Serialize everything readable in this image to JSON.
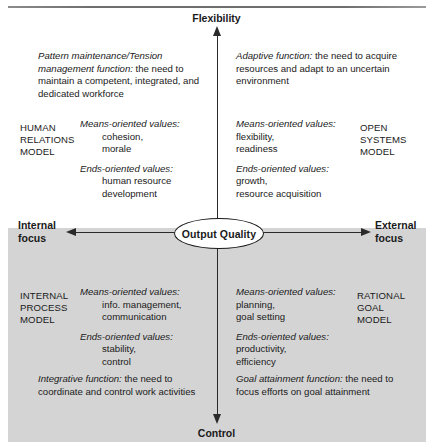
{
  "diagram": {
    "axes": {
      "top_label": "Flexibility",
      "bottom_label": "Control",
      "left_label_line1": "Internal",
      "left_label_line2": "focus",
      "right_label_line1": "External",
      "right_label_line2": "focus",
      "center_label": "Output Quality"
    },
    "colors": {
      "band_gray": "#d4d4d4",
      "line_black": "#2a2a2a",
      "text": "#1a1a1a",
      "background": "#ffffff"
    },
    "quadrants": [
      {
        "id": "top-left",
        "model_name_lines": [
          "HUMAN",
          "RELATIONS",
          "MODEL"
        ],
        "function_italic": "Pattern maintenance/Tension management function:",
        "function_rest": " the need to maintain a competent, integrated, and dedicated workforce",
        "means_header": "Means-oriented values:",
        "means_values": [
          "cohesion,",
          "morale"
        ],
        "ends_header": "Ends-oriented values:",
        "ends_values": [
          "human resource",
          "development"
        ]
      },
      {
        "id": "top-right",
        "model_name_lines": [
          "OPEN",
          "SYSTEMS",
          "MODEL"
        ],
        "function_italic": "Adaptive function:",
        "function_rest": " the need to acquire resources and adapt to an uncertain environment",
        "means_header": "Means-oriented values:",
        "means_values": [
          "flexibility,",
          "readiness"
        ],
        "ends_header": "Ends-oriented values:",
        "ends_values": [
          "growth,",
          "resource acquisition"
        ]
      },
      {
        "id": "bottom-left",
        "model_name_lines": [
          "INTERNAL",
          "PROCESS",
          "MODEL"
        ],
        "function_italic": "Integrative function:",
        "function_rest": " the need to coordinate and control work activities",
        "means_header": "Means-oriented values:",
        "means_values": [
          "info. management,",
          "communication"
        ],
        "ends_header": "Ends-oriented values:",
        "ends_values": [
          "stability,",
          "control"
        ]
      },
      {
        "id": "bottom-right",
        "model_name_lines": [
          "RATIONAL",
          "GOAL",
          "MODEL"
        ],
        "function_italic": "Goal attainment function:",
        "function_rest": " the need to focus efforts on goal attainment",
        "means_header": "Means-oriented values:",
        "means_values": [
          "planning,",
          "goal setting"
        ],
        "ends_header": "Ends-oriented values:",
        "ends_values": [
          "productivity,",
          "efficiency"
        ]
      }
    ]
  }
}
